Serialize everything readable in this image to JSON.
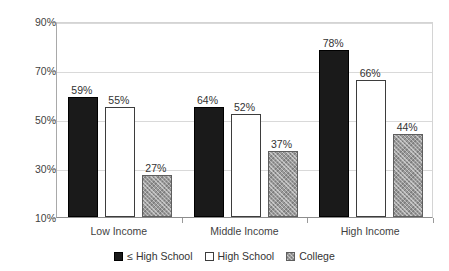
{
  "chart_data": {
    "type": "bar",
    "title": "",
    "subtitle": "",
    "xlabel": "",
    "ylabel": "",
    "categories": [
      "Low Income",
      "Middle Income",
      "High Income"
    ],
    "series": [
      {
        "name": "≤ High School",
        "values": [
          59,
          55,
          78
        ],
        "style": "solid-black",
        "color": "#1a1a1a"
      },
      {
        "name": "High School",
        "values": [
          55,
          52,
          66
        ],
        "style": "white-outline",
        "color": "#ffffff"
      },
      {
        "name": "College",
        "values": [
          27,
          37,
          44
        ],
        "style": "gray-hatched",
        "color": "#9a9a9a"
      }
    ],
    "value_labels": [
      [
        "59%",
        "64%",
        "78%"
      ],
      [
        "55%",
        "52%",
        "66%"
      ],
      [
        "27%",
        "37%",
        "44%"
      ]
    ],
    "ylim": [
      10,
      90
    ],
    "ytick_values": [
      90,
      70,
      50,
      30,
      10
    ],
    "ytick_labels": [
      "90%",
      "70%",
      "50%",
      "30%",
      "10%"
    ],
    "grid": true,
    "legend_position": "bottom"
  },
  "legend": {
    "items": [
      {
        "label": "≤ High School"
      },
      {
        "label": "High School"
      },
      {
        "label": "College"
      }
    ]
  }
}
